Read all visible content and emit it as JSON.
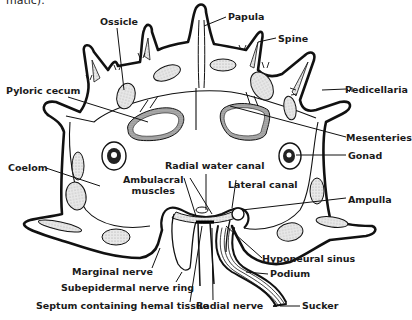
{
  "caption_fragment": "matic).",
  "diagram": {
    "labels": [
      {
        "id": "ossicle",
        "text": "Ossicle"
      },
      {
        "id": "papula",
        "text": "Papula"
      },
      {
        "id": "spine",
        "text": "Spine"
      },
      {
        "id": "pyloric-cecum",
        "text": "Pyloric cecum"
      },
      {
        "id": "pedicellaria",
        "text": "Pedicellaria"
      },
      {
        "id": "mesenteries",
        "text": "Mesenteries"
      },
      {
        "id": "gonad",
        "text": "Gonad"
      },
      {
        "id": "coelom",
        "text": "Coelom"
      },
      {
        "id": "radial-water-canal",
        "text": "Radial water canal"
      },
      {
        "id": "ambulacral-muscles",
        "text": "Ambulacral\nmuscles"
      },
      {
        "id": "lateral-canal",
        "text": "Lateral canal"
      },
      {
        "id": "ampulla",
        "text": "Ampulla"
      },
      {
        "id": "hyponeural-sinus",
        "text": "Hyponeural sinus"
      },
      {
        "id": "podium",
        "text": "Podium"
      },
      {
        "id": "marginal-nerve",
        "text": "Marginal nerve"
      },
      {
        "id": "subepidermal-nerve-ring",
        "text": "Subepidermal nerve ring"
      },
      {
        "id": "septum",
        "text": "Septum containing hemal tissue"
      },
      {
        "id": "radial-nerve",
        "text": "Radial nerve"
      },
      {
        "id": "sucker",
        "text": "Sucker"
      }
    ]
  }
}
